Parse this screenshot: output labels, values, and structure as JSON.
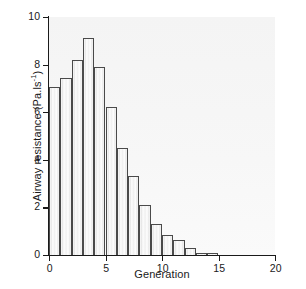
{
  "chart_data": {
    "type": "bar",
    "title": "",
    "xlabel": "Generation",
    "ylabel_text": "Airway resistance (Pa.ls",
    "ylabel_exponent": "-1",
    "ylabel_suffix": ")",
    "ylabel_full": "Airway resistance (Pa.ls⁻¹)",
    "categories": [
      0,
      1,
      2,
      3,
      4,
      5,
      6,
      7,
      8,
      9,
      10,
      11,
      12,
      13,
      14
    ],
    "values": [
      7.05,
      7.45,
      8.2,
      9.1,
      7.9,
      6.2,
      4.5,
      3.3,
      2.1,
      1.3,
      0.85,
      0.65,
      0.28,
      0.1,
      0.07
    ],
    "xlim": [
      0,
      20
    ],
    "ylim": [
      0,
      10
    ],
    "xticks": [
      0,
      5,
      10,
      15,
      20
    ],
    "yticks": [
      0,
      2,
      4,
      6,
      8,
      10
    ],
    "xtick_labels": [
      "0",
      "5",
      "10",
      "15",
      "20"
    ],
    "ytick_labels": [
      "0",
      "2",
      "4",
      "6",
      "8",
      "10"
    ],
    "grid": false,
    "legend": null,
    "bar_fill_color": "#f2f2f2",
    "bar_edge_color": "#4a4a4a",
    "axis_color": "#1a1a1a",
    "plot_background": "#f5f5f5",
    "figure_background": "#ffffff"
  }
}
